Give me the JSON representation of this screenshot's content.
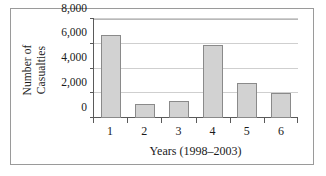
{
  "chart_data": {
    "type": "bar",
    "title": "",
    "subtitle": "",
    "xlabel": "Years (1998–2003)",
    "ylabel": "Number of Casualties",
    "ylabel_lines": [
      "Number of",
      "Casualties"
    ],
    "categories": [
      "1",
      "2",
      "3",
      "4",
      "5",
      "6"
    ],
    "values": [
      6700,
      1150,
      1350,
      5900,
      2800,
      2000
    ],
    "ylim": [
      0,
      8000
    ],
    "yticks": [
      0,
      2000,
      4000,
      6000,
      8000
    ],
    "ytick_labels": [
      "0",
      "2,000",
      "4,000",
      "6,000",
      "8,000"
    ],
    "grid": true,
    "grid_axis": "y",
    "legend": false,
    "legend_position": "none",
    "series": [
      {
        "name": "Number of Casualties",
        "values": [
          6700,
          1150,
          1350,
          5900,
          2800,
          2000
        ]
      }
    ],
    "colors": {
      "bar_fill": "#d2d2d2",
      "bar_border": "#8a8a8a",
      "gridline": "#cfcfcf",
      "axis": "#5a5a5a",
      "frame": "#9a9a9a",
      "background": "#ffffff",
      "text": "#1a1a1a"
    }
  }
}
